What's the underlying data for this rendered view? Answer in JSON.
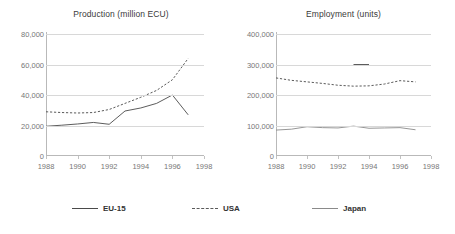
{
  "legend": {
    "items": [
      {
        "key": "eu15",
        "label": "EU-15",
        "style": "solid",
        "color": "#4a4a4a"
      },
      {
        "key": "usa",
        "label": "USA",
        "style": "dashed",
        "color": "#5a5a5a"
      },
      {
        "key": "japan",
        "label": "Japan",
        "style": "solid",
        "color": "#8a8a8a"
      }
    ]
  },
  "chart_data": [
    {
      "id": "production",
      "type": "line",
      "title": "Production (million ECU)",
      "xlabel": "",
      "ylabel": "",
      "xlim": [
        1988,
        1998
      ],
      "ylim": [
        0,
        80000
      ],
      "ytick_labels": [
        "80,000",
        "60,000",
        "40,000",
        "20,000",
        "0"
      ],
      "ytick_values": [
        80000,
        60000,
        40000,
        20000,
        0
      ],
      "xtick_labels": [
        "1988",
        "1990",
        "1992",
        "1994",
        "1996",
        "1998"
      ],
      "xtick_values": [
        1988,
        1990,
        1992,
        1994,
        1996,
        1998
      ],
      "grid": true,
      "legend_position": "bottom",
      "x": [
        1988,
        1989,
        1990,
        1991,
        1992,
        1993,
        1994,
        1995,
        1996,
        1997
      ],
      "series": [
        {
          "name": "EU-15",
          "style": "solid",
          "color": "#4a4a4a",
          "values": [
            19500,
            20200,
            21000,
            22000,
            20800,
            29500,
            31500,
            34500,
            40000,
            27000
          ]
        },
        {
          "name": "USA",
          "style": "dashed",
          "color": "#5a5a5a",
          "values": [
            29000,
            28500,
            28200,
            28500,
            30500,
            34500,
            38500,
            43000,
            50000,
            64000
          ]
        }
      ]
    },
    {
      "id": "employment",
      "type": "line",
      "title": "Employment (units)",
      "xlabel": "",
      "ylabel": "",
      "xlim": [
        1988,
        1998
      ],
      "ylim": [
        0,
        400000
      ],
      "ytick_labels": [
        "400,000",
        "300,000",
        "200,000",
        "100,000",
        "0"
      ],
      "ytick_values": [
        400000,
        300000,
        200000,
        100000,
        0
      ],
      "xtick_labels": [
        "1988",
        "1990",
        "1992",
        "1994",
        "1996",
        "1998"
      ],
      "xtick_values": [
        1988,
        1990,
        1992,
        1994,
        1996,
        1998
      ],
      "grid": true,
      "legend_position": "bottom",
      "x": [
        1988,
        1989,
        1990,
        1991,
        1992,
        1993,
        1994,
        1995,
        1996,
        1997
      ],
      "series": [
        {
          "name": "EU-15",
          "style": "solid",
          "color": "#4a4a4a",
          "partial": true,
          "partial_x": [
            1993,
            1994
          ],
          "values": [
            null,
            null,
            null,
            null,
            null,
            300000,
            300000,
            null,
            null,
            null
          ]
        },
        {
          "name": "USA",
          "style": "dashed",
          "color": "#5a5a5a",
          "values": [
            256000,
            248000,
            243000,
            238000,
            232000,
            229000,
            230000,
            236000,
            247000,
            243000
          ]
        },
        {
          "name": "Japan",
          "style": "solid",
          "color": "#8a8a8a",
          "values": [
            85000,
            88000,
            96000,
            93000,
            92000,
            98000,
            91000,
            92000,
            93000,
            86000
          ]
        }
      ]
    }
  ]
}
